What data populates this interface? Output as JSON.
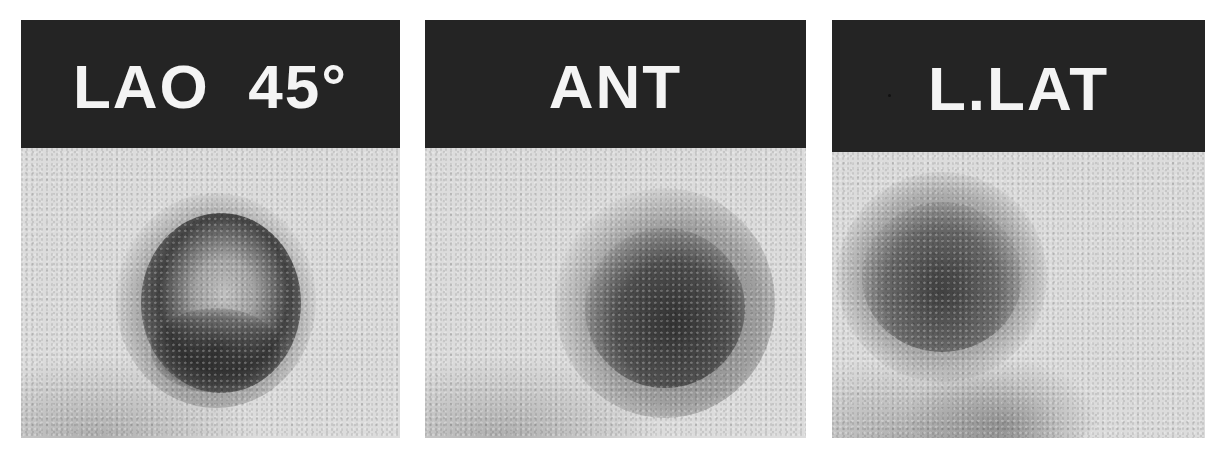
{
  "figure": {
    "panels": [
      {
        "label": "LAO  45°",
        "view": "left anterior oblique 45 degrees"
      },
      {
        "label": "ANT",
        "view": "anterior"
      },
      {
        "label": "L.LAT",
        "view": "left lateral"
      }
    ],
    "colors": {
      "label_band": "#242424",
      "label_text": "#f4f4f4",
      "background": "#dcdcdc",
      "uptake": "#3a3a3a"
    }
  }
}
